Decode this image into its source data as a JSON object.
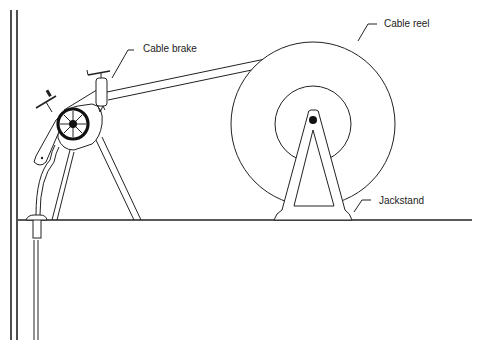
{
  "diagram": {
    "labels": {
      "cable_brake": "Cable brake",
      "cable_reel": "Cable reel",
      "jackstand": "Jackstand"
    },
    "colors": {
      "line": "#222222",
      "background": "#ffffff"
    }
  }
}
